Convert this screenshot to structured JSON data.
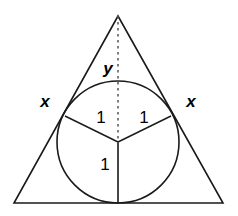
{
  "figure": {
    "background_color": "#ffffff",
    "stroke_color": "#1a1a1a",
    "dashed_color": "#555555",
    "label_color": "#000000",
    "width": 238,
    "height": 216
  },
  "triangle": {
    "name": "circumscribing-triangle",
    "apex": {
      "x": 118,
      "y": 16
    },
    "bottom_left": {
      "x": 14,
      "y": 203
    },
    "bottom_right": {
      "x": 223,
      "y": 203
    },
    "stroke_width": 1.6
  },
  "circle": {
    "name": "inscribed-circle",
    "center": {
      "x": 118,
      "y": 142
    },
    "radius": 61,
    "stroke_width": 1.6
  },
  "segments": [
    {
      "name": "radius-to-left-tangent-point",
      "from": {
        "x": 118,
        "y": 142
      },
      "to": {
        "x": 65,
        "y": 116
      },
      "style": "solid",
      "label": "1"
    },
    {
      "name": "radius-to-right-tangent-point",
      "from": {
        "x": 118,
        "y": 142
      },
      "to": {
        "x": 171,
        "y": 116
      },
      "style": "solid",
      "label": "1"
    },
    {
      "name": "radius-to-base-tangent-point",
      "from": {
        "x": 118,
        "y": 142
      },
      "to": {
        "x": 118,
        "y": 203
      },
      "style": "solid",
      "label": "1"
    },
    {
      "name": "altitude-apex-to-center",
      "from": {
        "x": 118,
        "y": 16
      },
      "to": {
        "x": 118,
        "y": 142
      },
      "style": "dashed",
      "label": "y"
    }
  ],
  "labels": [
    {
      "id": "label-y",
      "name": "label-y",
      "text": "y",
      "kind": "var",
      "x": 108,
      "y": 68
    },
    {
      "id": "label-x-left",
      "name": "label-x-left",
      "text": "x",
      "kind": "var",
      "x": 45,
      "y": 101
    },
    {
      "id": "label-x-right",
      "name": "label-x-right",
      "text": "x",
      "kind": "var",
      "x": 191,
      "y": 101
    },
    {
      "id": "label-one-left",
      "name": "label-one-left",
      "text": "1",
      "kind": "num",
      "x": 101,
      "y": 117
    },
    {
      "id": "label-one-right",
      "name": "label-one-right",
      "text": "1",
      "kind": "num",
      "x": 144,
      "y": 117
    },
    {
      "id": "label-one-bottom",
      "name": "label-one-bottom",
      "text": "1",
      "kind": "num",
      "x": 105,
      "y": 164
    }
  ]
}
